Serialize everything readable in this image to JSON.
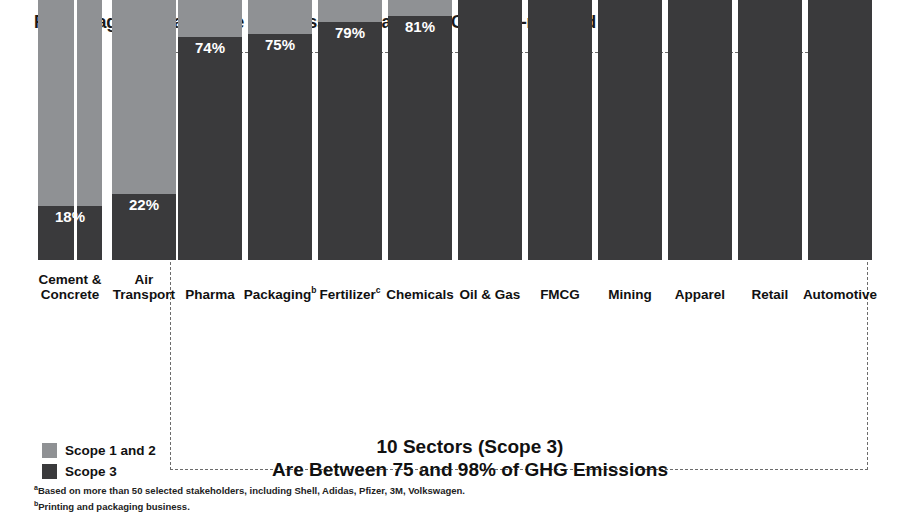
{
  "header": {
    "title": "Percentage of total Scope 1-3 emissions, based on CDP self-reported data",
    "title_superscript": "a"
  },
  "legend": {
    "items": [
      {
        "label": "Scope 1 and 2",
        "color": "#8f9194",
        "key": "scope12"
      },
      {
        "label": "Scope 3",
        "color": "#3a3a3c",
        "key": "scope3"
      }
    ]
  },
  "annotation": {
    "line1": "10 Sectors (Scope 3)",
    "line2": "Are Between 75 and 98% of GHG Emissions"
  },
  "footnotes": [
    {
      "marker": "a",
      "text": "Based on more than 50 selected stakeholders, including Shell, Adidas, Pfizer, 3M, Volkswagen."
    },
    {
      "marker": "b",
      "text": "Printing and packaging business."
    }
  ],
  "bars": [
    {
      "category": "Cement &",
      "category_line2": "Concrete",
      "superscript": "",
      "scope12": "82%",
      "scope3": "18%",
      "label_outside": false,
      "in_box": false
    },
    {
      "category": "Air",
      "category_line2": "Transport",
      "superscript": "",
      "scope12": "78%",
      "scope3": "22%",
      "label_outside": false,
      "in_box": false
    },
    {
      "category": "Pharma",
      "category_line2": "",
      "superscript": "",
      "scope12": "26%",
      "scope3": "74%",
      "label_outside": false,
      "in_box": true
    },
    {
      "category": "Packaging",
      "category_line2": "",
      "superscript": "b",
      "scope12": "25%",
      "scope3": "75%",
      "label_outside": false,
      "in_box": true
    },
    {
      "category": "Fertilizer",
      "category_line2": "",
      "superscript": "c",
      "scope12": "21%",
      "scope3": "79%",
      "label_outside": false,
      "in_box": true
    },
    {
      "category": "Chemicals",
      "category_line2": "",
      "superscript": "",
      "scope12": "19%",
      "scope3": "81%",
      "label_outside": false,
      "in_box": true
    },
    {
      "category": "Oil & Gas",
      "category_line2": "",
      "superscript": "",
      "scope12": "8%",
      "scope3": "92%",
      "label_outside": false,
      "in_box": true
    },
    {
      "category": "FMCG",
      "category_line2": "",
      "superscript": "",
      "scope12": "7%",
      "scope3": "93%",
      "label_outside": false,
      "in_box": true
    },
    {
      "category": "Mining",
      "category_line2": "",
      "superscript": "",
      "scope12": "5%",
      "scope3": "95%",
      "label_outside": true,
      "in_box": true
    },
    {
      "category": "Apparel",
      "category_line2": "",
      "superscript": "",
      "scope12": "5%",
      "scope3": "95%",
      "label_outside": true,
      "in_box": true
    },
    {
      "category": "Retail",
      "category_line2": "",
      "superscript": "",
      "scope12": "4%",
      "scope3": "96%",
      "label_outside": true,
      "in_box": true
    },
    {
      "category": "Automotive",
      "category_line2": "",
      "superscript": "",
      "scope12": "2%",
      "scope3": "98%",
      "label_outside": true,
      "in_box": true
    }
  ],
  "chart_data": {
    "type": "bar",
    "subtype": "stacked-100-percent-vertical",
    "title": "Percentage of total Scope 1-3 emissions, based on CDP self-reported data",
    "xlabel": "",
    "ylabel": "Percentage of total Scope 1-3 emissions",
    "ylim": [
      0,
      100
    ],
    "grid": false,
    "legend_position": "bottom-left",
    "categories": [
      "Cement & Concrete",
      "Air Transport",
      "Pharma",
      "Packaging",
      "Fertilizer",
      "Chemicals",
      "Oil & Gas",
      "FMCG",
      "Mining",
      "Apparel",
      "Retail",
      "Automotive"
    ],
    "series": [
      {
        "name": "Scope 1 and 2",
        "color": "#8f9194",
        "values": [
          82,
          78,
          26,
          25,
          21,
          19,
          8,
          7,
          5,
          5,
          4,
          2
        ]
      },
      {
        "name": "Scope 3",
        "color": "#3a3a3c",
        "values": [
          18,
          22,
          74,
          75,
          79,
          81,
          92,
          93,
          95,
          95,
          96,
          98
        ]
      }
    ],
    "annotations": [
      "10 Sectors (Scope 3) Are Between 75 and 98% of GHG Emissions"
    ],
    "highlight_group": {
      "label": "10 Sectors (Scope 3)",
      "categories": [
        "Pharma",
        "Packaging",
        "Fertilizer",
        "Chemicals",
        "Oil & Gas",
        "FMCG",
        "Mining",
        "Apparel",
        "Retail",
        "Automotive"
      ]
    }
  }
}
